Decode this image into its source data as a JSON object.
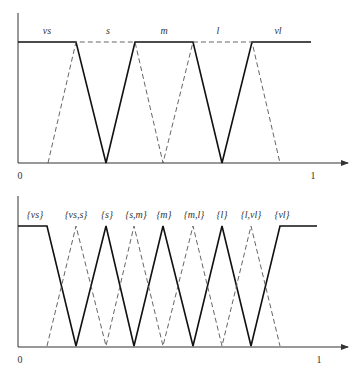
{
  "top_chart": {
    "labels": [
      "vs",
      "s",
      "m",
      "l",
      "vl"
    ],
    "x_min_label": "0",
    "x_max_label": "1"
  },
  "bottom_chart": {
    "labels": [
      "{vs}",
      "{vs,s}",
      "{s}",
      "{s,m}",
      "{m}",
      "{m,l}",
      "{l}",
      "{l,vl}",
      "{vl}"
    ],
    "x_min_label": "0",
    "x_max_label": "1"
  },
  "colors": {
    "solid": "#111111",
    "dashed": "#555555",
    "axis": "#333333"
  }
}
